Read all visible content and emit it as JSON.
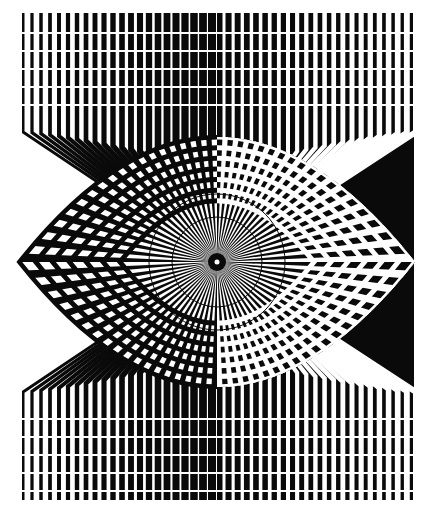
{
  "artwork": {
    "title": "Op-art radial eye composition",
    "style": "black and white optical art",
    "canvas": {
      "width": 434,
      "height": 516,
      "background": "#ffffff"
    },
    "colors": {
      "ink": "#0a0a0a",
      "paper": "#ffffff"
    },
    "frame": {
      "left": 22,
      "right": 414,
      "top": 13,
      "bottom": 500
    },
    "center": {
      "x": 217,
      "y": 262
    },
    "bars": {
      "count_per_side": 22,
      "left_half": {
        "x_start": 23,
        "x_end": 212,
        "bar_width_start": 3,
        "bar_width_end": 8
      },
      "right_half": {
        "x_start": 220,
        "x_end": 412,
        "bar_width_start": 12,
        "bar_width_end": 4
      }
    },
    "row_gaps": {
      "top_band": [
        32,
        50,
        68,
        86,
        104
      ],
      "bottom_band": [
        418,
        436,
        454,
        472,
        490
      ],
      "gap_height": 2
    },
    "lens": {
      "rx": 198,
      "ry": 125,
      "arc_rings": 7,
      "ray_count": 72
    },
    "inner_circles": [
      {
        "r": 68
      },
      {
        "r": 45
      }
    ],
    "pupil": {
      "r": 9,
      "highlight_r": 2.5
    }
  }
}
